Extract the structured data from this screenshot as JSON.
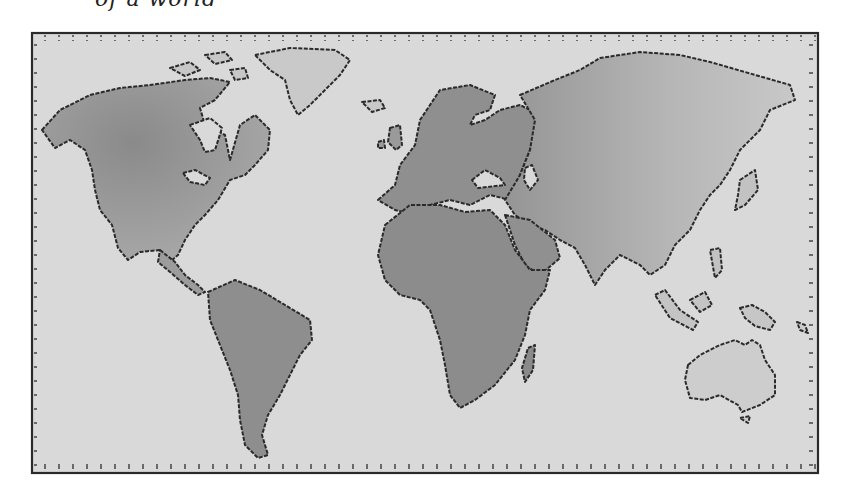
{
  "caption": {
    "text": "of a world"
  },
  "map": {
    "title": "Hand-drawn world map",
    "style": "grayscale watercolor",
    "colors": {
      "paper": "#d9d9d9",
      "land_dark": "#8f8f8f",
      "land_mid": "#a8a8a8",
      "land_light": "#c4c4c4",
      "outline": "#2a2a2a",
      "background": "#ffffff"
    },
    "frame": {
      "x": 32,
      "y": 33,
      "width": 786,
      "height": 440
    },
    "continents": [
      {
        "name": "North America"
      },
      {
        "name": "Greenland"
      },
      {
        "name": "South America"
      },
      {
        "name": "Europe"
      },
      {
        "name": "Africa"
      },
      {
        "name": "Madagascar"
      },
      {
        "name": "Asia"
      },
      {
        "name": "Japan"
      },
      {
        "name": "Indonesia"
      },
      {
        "name": "New Guinea"
      },
      {
        "name": "Australia"
      },
      {
        "name": "New Zealand"
      }
    ]
  }
}
